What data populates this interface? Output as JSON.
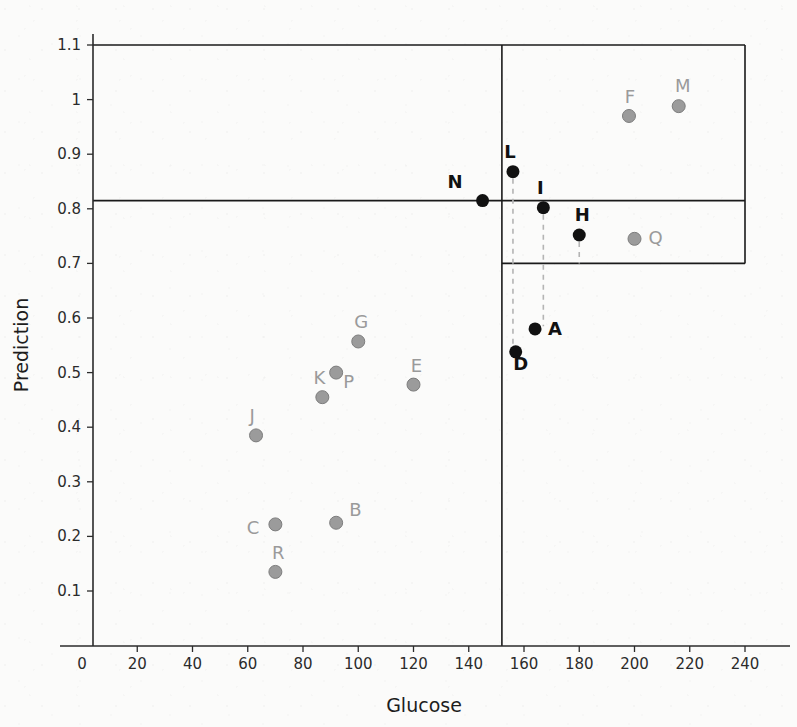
{
  "chart_data": {
    "type": "scatter",
    "title": "",
    "xlabel": "Glucose",
    "ylabel": "Prediction",
    "xlim": [
      0,
      240
    ],
    "ylim": [
      0.05,
      1.13
    ],
    "xticks": [
      0,
      20,
      40,
      60,
      80,
      100,
      120,
      140,
      160,
      180,
      200,
      220,
      240
    ],
    "xtick_labels": [
      "0",
      "20",
      "40",
      "60",
      "80",
      "100",
      "120",
      "140",
      "160",
      "180",
      "200",
      "220",
      "240"
    ],
    "yticks": [
      0.1,
      0.2,
      0.3,
      0.4,
      0.5,
      0.6,
      0.7,
      0.8,
      0.9,
      1.0,
      1.1
    ],
    "ytick_labels": [
      "0.1",
      "0.2",
      "0.3",
      "0.4",
      "0.5",
      "0.6",
      "0.7",
      "0.8",
      "0.9",
      "1",
      "1.1"
    ],
    "grid": false,
    "legend": "none",
    "thresholds": {
      "prediction_upper": 0.815,
      "prediction_lower": 0.7,
      "glucose_vertical": 152,
      "glucose_right_edge": 240,
      "prediction_top": 1.1
    },
    "series": [
      {
        "name": "highlighted",
        "marker": "filled-circle",
        "color": "#111111",
        "label_color": "#111111",
        "points": [
          {
            "label": "N",
            "x": 145,
            "y": 0.815,
            "lx": -20,
            "ly": -13,
            "leader": false
          },
          {
            "label": "L",
            "x": 156,
            "y": 0.868,
            "lx": -3,
            "ly": -14,
            "leader": true,
            "leader_to": 0.545
          },
          {
            "label": "I",
            "x": 167,
            "y": 0.802,
            "lx": -3,
            "ly": -14,
            "leader": true,
            "leader_to": 0.585
          },
          {
            "label": "H",
            "x": 180,
            "y": 0.752,
            "lx": 3,
            "ly": -14,
            "leader": true,
            "leader_to": 0.7
          },
          {
            "label": "A",
            "x": 164,
            "y": 0.58,
            "lx": 13,
            "ly": 6,
            "leader": false
          },
          {
            "label": "D",
            "x": 157,
            "y": 0.538,
            "lx": 5,
            "ly": 18,
            "leader": false
          }
        ]
      },
      {
        "name": "baseline",
        "marker": "filled-circle",
        "color": "#9b9b9b",
        "label_color": "#9a9a9a",
        "points": [
          {
            "label": "F",
            "x": 198,
            "y": 0.97,
            "lx": 1,
            "ly": -13
          },
          {
            "label": "M",
            "x": 216,
            "y": 0.988,
            "lx": 4,
            "ly": -14
          },
          {
            "label": "Q",
            "x": 200,
            "y": 0.745,
            "lx": 14,
            "ly": 5
          },
          {
            "label": "G",
            "x": 100,
            "y": 0.557,
            "lx": 3,
            "ly": -13
          },
          {
            "label": "E",
            "x": 120,
            "y": 0.478,
            "lx": 3,
            "ly": -13
          },
          {
            "label": "P",
            "x": 92,
            "y": 0.5,
            "lx": 7,
            "ly": 15
          },
          {
            "label": "K",
            "x": 87,
            "y": 0.455,
            "lx": -3,
            "ly": -13
          },
          {
            "label": "J",
            "x": 63,
            "y": 0.385,
            "lx": -4,
            "ly": -13
          },
          {
            "label": "C",
            "x": 70,
            "y": 0.222,
            "lx": -16,
            "ly": 10
          },
          {
            "label": "B",
            "x": 92,
            "y": 0.225,
            "lx": 13,
            "ly": -7
          },
          {
            "label": "R",
            "x": 70,
            "y": 0.135,
            "lx": 3,
            "ly": -13
          }
        ]
      }
    ]
  },
  "style": {
    "axis_color": "#2b2b2b",
    "threshold_color": "#1a1a1a",
    "leader_color": "#b4b4b4",
    "background": "#fbfbfa"
  }
}
